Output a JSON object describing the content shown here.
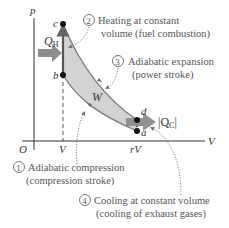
{
  "diagram": {
    "axes": {
      "y_label": "p",
      "x_label": "V",
      "origin_label": "O",
      "x_ticks": [
        "V",
        "rV"
      ]
    },
    "points": {
      "a": "a",
      "b": "b",
      "c": "c",
      "d": "d"
    },
    "work_label": "W",
    "heat_in": {
      "symbol": "Q",
      "subscript": "H"
    },
    "heat_out": {
      "symbol": "|Q",
      "subscript": "C",
      "close": "|"
    },
    "steps": [
      {
        "number": "1",
        "line1": "Adiabatic compression",
        "line2": "(compression stroke)"
      },
      {
        "number": "2",
        "line1": "Heating at constant",
        "line2": "volume (fuel combustion)"
      },
      {
        "number": "3",
        "line1": "Adiabatic expansion",
        "line2": "(power stroke)"
      },
      {
        "number": "4",
        "line1": "Cooling at constant volume",
        "line2": "(cooling of exhaust gases)"
      }
    ],
    "colors": {
      "region_fill": "#d3d3d3",
      "curve": "#7a7a7a",
      "point": "#111111",
      "heat_arrow": "#8c8c8c",
      "text": "#555555",
      "axis": "#333333"
    }
  }
}
